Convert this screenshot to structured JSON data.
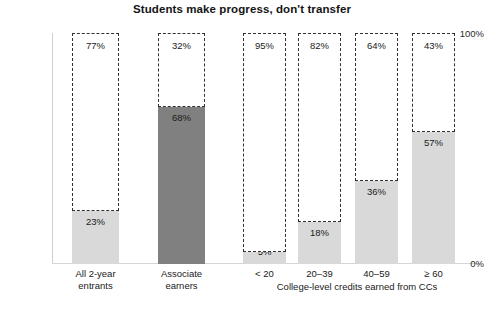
{
  "chart_data": {
    "type": "bar",
    "title": "Students make progress, don't transfer",
    "xlabel": "",
    "ylabel": "",
    "ylim": [
      0,
      100
    ],
    "grid": false,
    "legend": "none",
    "stacked": true,
    "y_ticks": [
      "100%",
      "0%"
    ],
    "y_tick_values": [
      100,
      0
    ],
    "group_label": "College-level credits earned from CCs",
    "categories": [
      "All 2-year entrants",
      "Associate earners",
      "< 20",
      "20–39",
      "40–59",
      "≥ 60"
    ],
    "series": [
      {
        "name": "Did not transfer",
        "style": "dashed-outline",
        "values": [
          77,
          32,
          95,
          82,
          64,
          43
        ],
        "labels": [
          "77%",
          "32%",
          "95%",
          "82%",
          "64%",
          "43%"
        ]
      },
      {
        "name": "Transferred",
        "style": "filled",
        "values": [
          23,
          68,
          5,
          18,
          36,
          57
        ],
        "labels": [
          "23%",
          "68%",
          "5%",
          "18%",
          "36%",
          "57%"
        ]
      }
    ]
  },
  "colors": {
    "fill_light": "#d9d9d9",
    "fill_dark": "#808080",
    "dash_outline": "#303030",
    "axis": "#d6d6d6",
    "text": "#1a1a1a",
    "background": "#ffffff"
  },
  "bars": [
    {
      "key": "all-2-year-entrants",
      "label_line1": "All 2-year",
      "label_line2": "entrants",
      "top_label": "77%",
      "bottom_label": "23%",
      "top_value": 77,
      "bottom_value": 23,
      "fill": "#d9d9d9"
    },
    {
      "key": "associate-earners",
      "label_line1": "Associate",
      "label_line2": "earners",
      "top_label": "32%",
      "bottom_label": "68%",
      "top_value": 32,
      "bottom_value": 68,
      "fill": "#808080"
    },
    {
      "key": "credits-under-20",
      "label_line1": "< 20",
      "label_line2": "",
      "top_label": "95%",
      "bottom_label": "5%",
      "top_value": 95,
      "bottom_value": 5,
      "fill": "#d9d9d9"
    },
    {
      "key": "credits-20-39",
      "label_line1": "20–39",
      "label_line2": "",
      "top_label": "82%",
      "bottom_label": "18%",
      "top_value": 82,
      "bottom_value": 18,
      "fill": "#d9d9d9"
    },
    {
      "key": "credits-40-59",
      "label_line1": "40–59",
      "label_line2": "",
      "top_label": "64%",
      "bottom_label": "36%",
      "top_value": 64,
      "bottom_value": 36,
      "fill": "#d9d9d9"
    },
    {
      "key": "credits-60-plus",
      "label_line1": "≥ 60",
      "label_line2": "",
      "top_label": "43%",
      "bottom_label": "57%",
      "top_value": 43,
      "bottom_value": 57,
      "fill": "#d9d9d9"
    }
  ],
  "layout": {
    "bar_geometry": [
      {
        "left": 72,
        "width": 47
      },
      {
        "left": 158,
        "width": 47
      },
      {
        "left": 243,
        "width": 43
      },
      {
        "left": 298,
        "width": 43
      },
      {
        "left": 355,
        "width": 43
      },
      {
        "left": 412,
        "width": 43
      }
    ],
    "plot_top": 33,
    "plot_bottom": 264,
    "axis_left": 52
  }
}
